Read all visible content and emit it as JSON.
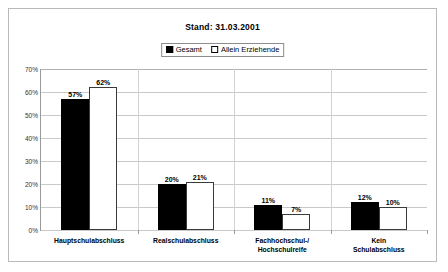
{
  "chart_data": {
    "type": "bar",
    "title": "Stand: 31.03.2001",
    "xlabel": "",
    "ylabel": "",
    "ylim": [
      0,
      70
    ],
    "ytick_labels": [
      "0%",
      "10%",
      "20%",
      "30%",
      "40%",
      "50%",
      "60%",
      "70%"
    ],
    "ytick_values": [
      0,
      10,
      20,
      30,
      40,
      50,
      60,
      70
    ],
    "grid": true,
    "legend_position": "top-center",
    "categories": [
      "Hauptschulabschluss",
      "Realschulabschluss",
      "Fachhochschul-/\nHochschulreife",
      "Kein Schulabschluss"
    ],
    "series": [
      {
        "name": "Gesamt",
        "color": "#000000",
        "values": [
          57,
          20,
          11,
          12
        ],
        "labels": [
          "57%",
          "20%",
          "11%",
          "12%"
        ]
      },
      {
        "name": "Allein Erziehende",
        "color": "#ffffff",
        "values": [
          62,
          21,
          7,
          10
        ],
        "labels": [
          "62%",
          "21%",
          "7%",
          "10%"
        ]
      }
    ]
  },
  "legend": {
    "items": [
      {
        "label": "Gesamt",
        "style": "filled"
      },
      {
        "label": "Allein Erziehende",
        "style": "hollow"
      }
    ]
  }
}
